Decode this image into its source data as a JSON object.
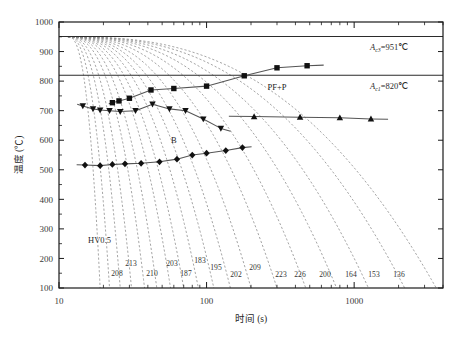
{
  "chart_data": {
    "type": "line",
    "title": "",
    "xlabel": "时间 (s)",
    "ylabel": "温度 (℃)",
    "xscale": "log",
    "xlim": [
      10,
      4000
    ],
    "ylim": [
      100,
      1000
    ],
    "xtick_labels": [
      "10",
      "100",
      "1000"
    ],
    "xtick_values": [
      10,
      100,
      1000
    ],
    "ytick_labels": [
      "100",
      "200",
      "300",
      "400",
      "500",
      "600",
      "700",
      "800",
      "900",
      "1000"
    ],
    "ytick_values": [
      100,
      200,
      300,
      400,
      500,
      600,
      700,
      800,
      900,
      1000
    ],
    "grid": false,
    "legend": "none",
    "reference_lines": [
      {
        "name": "Ac3",
        "label_sub": "c3",
        "label_prefix": "A",
        "label_value": "=951℃",
        "value": 951
      },
      {
        "name": "Ac1",
        "label_sub": "c1",
        "label_prefix": "A",
        "label_value": "=820℃",
        "value": 820
      }
    ],
    "region_labels": [
      {
        "text": "PF+P",
        "x": 300,
        "y": 770
      },
      {
        "text": "B",
        "x": 60,
        "y": 590
      }
    ],
    "hardness_label": "HV0.5",
    "hardness_values": [
      208,
      213,
      210,
      203,
      187,
      183,
      195,
      202,
      209,
      223,
      226,
      200,
      164,
      153,
      136
    ],
    "series": [
      {
        "name": "transformation-start-ferrite-pearlite",
        "marker": "square",
        "points": [
          {
            "t": 23.0,
            "T": 727
          },
          {
            "t": 25.5,
            "T": 733
          },
          {
            "t": 30.0,
            "T": 742
          },
          {
            "t": 42.0,
            "T": 770
          },
          {
            "t": 60.0,
            "T": 775
          },
          {
            "t": 100.0,
            "T": 783
          },
          {
            "t": 180.0,
            "T": 818
          },
          {
            "t": 300.0,
            "T": 845
          },
          {
            "t": 480.0,
            "T": 852
          }
        ]
      },
      {
        "name": "transformation-start-bainite-upper",
        "marker": "triangle-down",
        "points": [
          {
            "t": 14.5,
            "T": 716
          },
          {
            "t": 17.0,
            "T": 706
          },
          {
            "t": 19.0,
            "T": 702
          },
          {
            "t": 22.0,
            "T": 700
          },
          {
            "t": 26.0,
            "T": 697
          },
          {
            "t": 33.0,
            "T": 700
          },
          {
            "t": 43.0,
            "T": 722
          },
          {
            "t": 56.0,
            "T": 706
          },
          {
            "t": 72.0,
            "T": 700
          },
          {
            "t": 95.0,
            "T": 672
          },
          {
            "t": 125.0,
            "T": 640
          }
        ]
      },
      {
        "name": "transformation-finish-upper",
        "marker": "triangle-up",
        "points": [
          {
            "t": 210.0,
            "T": 680
          },
          {
            "t": 430.0,
            "T": 678
          },
          {
            "t": 800.0,
            "T": 676
          },
          {
            "t": 1300.0,
            "T": 672
          }
        ]
      },
      {
        "name": "transformation-finish-bainite",
        "marker": "diamond",
        "points": [
          {
            "t": 15.0,
            "T": 516
          },
          {
            "t": 19.0,
            "T": 514
          },
          {
            "t": 23.0,
            "T": 518
          },
          {
            "t": 28.0,
            "T": 520
          },
          {
            "t": 36.0,
            "T": 522
          },
          {
            "t": 48.0,
            "T": 527
          },
          {
            "t": 63.0,
            "T": 536
          },
          {
            "t": 80.0,
            "T": 550
          },
          {
            "t": 100.0,
            "T": 556
          },
          {
            "t": 135.0,
            "T": 565
          },
          {
            "t": 175.0,
            "T": 575
          }
        ]
      }
    ],
    "cooling_curves_start": {
      "t": 11.5,
      "T": 950
    },
    "cooling_curve_end_times": [
      19,
      22,
      26,
      31,
      38,
      46,
      57,
      70,
      88,
      112,
      145,
      200,
      300,
      470,
      760,
      1250,
      2200,
      3600
    ],
    "cooling_curve_count": 18
  },
  "styles": {
    "frame_color": "#1a1a1a",
    "curve_color": "#555555",
    "dash_color": "#888888",
    "marker_color": "#111111",
    "bg": "#ffffff"
  }
}
